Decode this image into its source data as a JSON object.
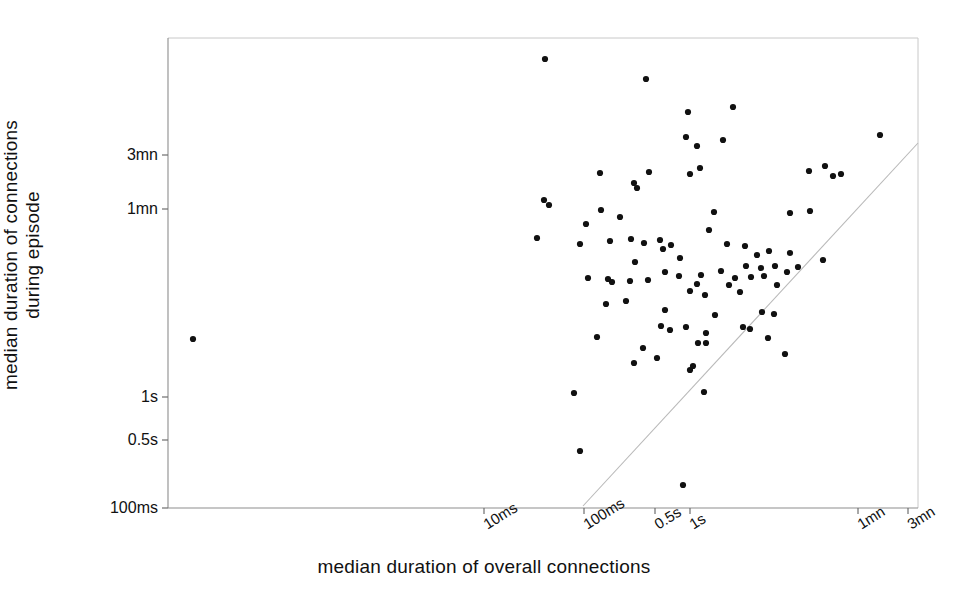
{
  "chart_data": {
    "type": "scatter",
    "title": "",
    "xlabel": "median duration of overall connections",
    "ylabel": "median duration of connections during episode",
    "ylabel_lines": [
      "median duration of connections",
      "during episode"
    ],
    "xscale": "log",
    "yscale": "log",
    "grid": false,
    "legend": null,
    "xticks": [
      {
        "label": "10ms",
        "px": 484
      },
      {
        "label": "100ms",
        "px": 584
      },
      {
        "label": "0.5s",
        "px": 655
      },
      {
        "label": "1s",
        "px": 690
      },
      {
        "label": "1mn",
        "px": 858
      },
      {
        "label": "3mn",
        "px": 908
      }
    ],
    "yticks": [
      {
        "label": "3mn",
        "px": 155
      },
      {
        "label": "1mn",
        "px": 209
      },
      {
        "label": "1s",
        "px": 397
      },
      {
        "label": "0.5s",
        "px": 440
      },
      {
        "label": "100ms",
        "px": 508
      }
    ],
    "reference_line": {
      "description": "y = x diagonal identity line",
      "x1_px": 583,
      "y1_px": 506,
      "x2_px": 918,
      "y2_px": 143,
      "color": "#b9b9b9"
    },
    "plot_area_px": {
      "left": 168,
      "top": 38,
      "right": 918,
      "bottom": 508
    },
    "marker": {
      "shape": "dot",
      "color": "#111111",
      "size_px": 4
    },
    "n_points": 93,
    "points_px": [
      [
        193,
        339
      ],
      [
        545,
        59
      ],
      [
        646,
        79
      ],
      [
        649,
        172
      ],
      [
        600,
        173
      ],
      [
        688,
        112
      ],
      [
        723,
        140
      ],
      [
        733,
        107
      ],
      [
        686,
        137
      ],
      [
        697,
        146
      ],
      [
        690,
        174
      ],
      [
        700,
        168
      ],
      [
        809,
        171
      ],
      [
        825,
        166
      ],
      [
        833,
        176
      ],
      [
        841,
        174
      ],
      [
        880,
        135
      ],
      [
        544,
        200
      ],
      [
        549,
        205
      ],
      [
        634,
        183
      ],
      [
        637,
        188
      ],
      [
        810,
        211
      ],
      [
        790,
        213
      ],
      [
        601,
        210
      ],
      [
        620,
        217
      ],
      [
        714,
        212
      ],
      [
        631,
        239
      ],
      [
        644,
        243
      ],
      [
        660,
        240
      ],
      [
        586,
        224
      ],
      [
        663,
        249
      ],
      [
        671,
        245
      ],
      [
        709,
        230
      ],
      [
        537,
        238
      ],
      [
        580,
        244
      ],
      [
        610,
        241
      ],
      [
        635,
        262
      ],
      [
        680,
        258
      ],
      [
        745,
        246
      ],
      [
        757,
        255
      ],
      [
        769,
        251
      ],
      [
        761,
        268
      ],
      [
        746,
        266
      ],
      [
        790,
        253
      ],
      [
        727,
        244
      ],
      [
        679,
        276
      ],
      [
        701,
        275
      ],
      [
        665,
        272
      ],
      [
        612,
        282
      ],
      [
        608,
        279
      ],
      [
        588,
        278
      ],
      [
        630,
        281
      ],
      [
        648,
        280
      ],
      [
        697,
        284
      ],
      [
        721,
        271
      ],
      [
        735,
        278
      ],
      [
        751,
        277
      ],
      [
        764,
        276
      ],
      [
        775,
        266
      ],
      [
        787,
        272
      ],
      [
        798,
        267
      ],
      [
        729,
        285
      ],
      [
        777,
        285
      ],
      [
        823,
        260
      ],
      [
        606,
        304
      ],
      [
        626,
        301
      ],
      [
        665,
        310
      ],
      [
        690,
        291
      ],
      [
        705,
        295
      ],
      [
        740,
        292
      ],
      [
        661,
        326
      ],
      [
        670,
        330
      ],
      [
        686,
        327
      ],
      [
        762,
        312
      ],
      [
        774,
        314
      ],
      [
        706,
        333
      ],
      [
        715,
        315
      ],
      [
        750,
        329
      ],
      [
        743,
        327
      ],
      [
        597,
        337
      ],
      [
        698,
        343
      ],
      [
        768,
        338
      ],
      [
        643,
        348
      ],
      [
        657,
        358
      ],
      [
        634,
        363
      ],
      [
        693,
        366
      ],
      [
        690,
        370
      ],
      [
        785,
        354
      ],
      [
        706,
        343
      ],
      [
        704,
        392
      ],
      [
        574,
        393
      ],
      [
        580,
        451
      ],
      [
        683,
        485
      ]
    ]
  },
  "icons": {
    "data_point": "dot-marker"
  }
}
